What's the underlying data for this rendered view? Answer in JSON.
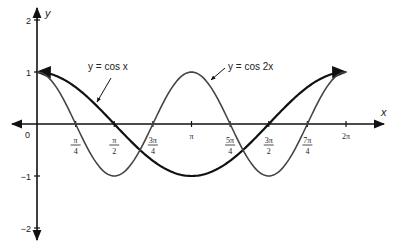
{
  "chart_data": {
    "type": "line",
    "title": "",
    "xlabel": "x",
    "ylabel": "y",
    "xlim": [
      0,
      6.2832
    ],
    "ylim": [
      -2,
      2
    ],
    "grid": false,
    "x_ticks": [
      {
        "value": 0.7854,
        "num": "π",
        "den": "4"
      },
      {
        "value": 1.5708,
        "num": "π",
        "den": "2"
      },
      {
        "value": 2.3562,
        "num": "3π",
        "den": "4"
      },
      {
        "value": 3.1416,
        "label": "π"
      },
      {
        "value": 3.927,
        "num": "5π",
        "den": "4"
      },
      {
        "value": 4.7124,
        "num": "3π",
        "den": "2"
      },
      {
        "value": 5.4978,
        "num": "7π",
        "den": "4"
      },
      {
        "value": 6.2832,
        "label": "2π"
      }
    ],
    "y_ticks": [
      {
        "value": 2,
        "label": "2"
      },
      {
        "value": 1,
        "label": "1"
      },
      {
        "value": -1,
        "label": "−1"
      },
      {
        "value": -2,
        "label": "−2"
      }
    ],
    "origin_label": "0",
    "series": [
      {
        "name": "y = cos x",
        "function": "cos(x)",
        "color": "#111111",
        "stroke_width": 2.2
      },
      {
        "name": "y = cos 2x",
        "function": "cos(2x)",
        "color": "#444444",
        "stroke_width": 1.6
      }
    ],
    "annotations": [
      {
        "text": "y = cos x",
        "points_to": "cos x curve"
      },
      {
        "text": "y = cos 2x",
        "points_to": "cos 2x curve"
      }
    ]
  },
  "labels": {
    "x_axis": "x",
    "y_axis": "y",
    "origin": "0",
    "cosx": "y = cos x",
    "cos2x": "y = cos 2x"
  }
}
